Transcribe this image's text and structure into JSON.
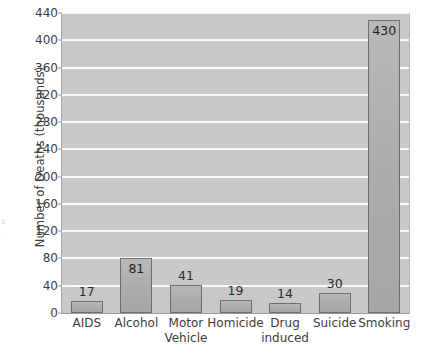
{
  "chart_data": {
    "type": "bar",
    "title": "",
    "xlabel": "",
    "ylabel": "Number of Deaths (thousands)",
    "ylim": [
      0,
      440
    ],
    "ytick_step": 40,
    "yticks": [
      0,
      40,
      80,
      120,
      160,
      200,
      240,
      280,
      320,
      360,
      400,
      440
    ],
    "grid": true,
    "legend": "none",
    "categories": [
      "AIDS",
      "Alcohol",
      "Motor Vehicle",
      "Homicide",
      "Drug induced",
      "Suicide",
      "Smoking"
    ],
    "category_lines": [
      [
        "AIDS",
        ""
      ],
      [
        "Alcohol",
        ""
      ],
      [
        "Motor",
        "Vehicle"
      ],
      [
        "Homicide",
        ""
      ],
      [
        "Drug",
        "induced"
      ],
      [
        "Suicide",
        ""
      ],
      [
        "Smoking",
        ""
      ]
    ],
    "values": [
      17,
      81,
      41,
      19,
      14,
      30,
      430
    ],
    "value_labels": [
      "17",
      "81",
      "41",
      "19",
      "14",
      "30",
      "430"
    ],
    "colors": {
      "plot_background": "#c9c9c9",
      "gridline": "#fbfbfb",
      "bar_fill": "#ababab",
      "bar_edge": "#6e6e6e",
      "text": "#3d3d3d",
      "page_background": "#ffffff"
    }
  },
  "artifacts": {
    "left_edge_marks": [
      "s",
      "·"
    ]
  }
}
